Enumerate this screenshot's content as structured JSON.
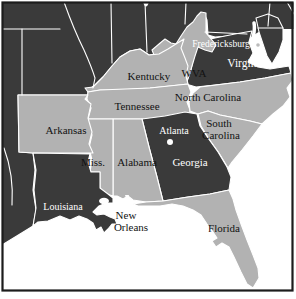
{
  "map": {
    "description_visible_text_only": true,
    "colors": {
      "dark_state": "#3a3a3a",
      "light_state": "#b2b2b2",
      "water": "#ffffff",
      "state_border": "#ffffff",
      "frame": "#1c1c1c",
      "label_dark_text": "#121212",
      "label_light_text": "#ffffff"
    },
    "labels": [
      {
        "id": "fredericksburg",
        "text": "Fredericksburg",
        "x": 221,
        "y": 47,
        "fill": "#ffffff",
        "size": 9.5
      },
      {
        "id": "wva",
        "text": "WVA",
        "x": 194,
        "y": 77,
        "fill": "#121212",
        "size": 11
      },
      {
        "id": "virginia",
        "text": "Virginia",
        "x": 246,
        "y": 67,
        "fill": "#ffffff",
        "size": 11.5
      },
      {
        "id": "kentucky",
        "text": "Kentucky",
        "x": 149,
        "y": 80,
        "fill": "#121212",
        "size": 11
      },
      {
        "id": "tennessee",
        "text": "Tennessee",
        "x": 137,
        "y": 110,
        "fill": "#121212",
        "size": 11
      },
      {
        "id": "north-carolina",
        "text": "North Carolina",
        "x": 208,
        "y": 101,
        "fill": "#121212",
        "size": 11
      },
      {
        "id": "arkansas",
        "text": "Arkansas",
        "x": 66,
        "y": 134,
        "fill": "#121212",
        "size": 11
      },
      {
        "id": "south",
        "text": "South",
        "x": 219,
        "y": 127,
        "fill": "#121212",
        "size": 11
      },
      {
        "id": "carolina",
        "text": "Carolina",
        "x": 221,
        "y": 139,
        "fill": "#121212",
        "size": 11
      },
      {
        "id": "atlanta",
        "text": "Atlanta",
        "x": 174,
        "y": 134,
        "fill": "#ffffff",
        "size": 10
      },
      {
        "id": "miss",
        "text": "Miss.",
        "x": 93,
        "y": 166,
        "fill": "#121212",
        "size": 11
      },
      {
        "id": "alabama",
        "text": "Alabama",
        "x": 137,
        "y": 166,
        "fill": "#121212",
        "size": 11
      },
      {
        "id": "georgia",
        "text": "Georgia",
        "x": 190,
        "y": 166,
        "fill": "#ffffff",
        "size": 11
      },
      {
        "id": "louisiana",
        "text": "Louisiana",
        "x": 63,
        "y": 210,
        "fill": "#ffffff",
        "size": 10
      },
      {
        "id": "new",
        "text": "New",
        "x": 126,
        "y": 219,
        "fill": "#121212",
        "size": 11
      },
      {
        "id": "orleans",
        "text": "Orleans",
        "x": 131,
        "y": 231,
        "fill": "#121212",
        "size": 11
      },
      {
        "id": "florida",
        "text": "Florida",
        "x": 224,
        "y": 232,
        "fill": "#121212",
        "size": 11
      }
    ],
    "cities": [
      {
        "id": "atlanta-dot",
        "x": 170,
        "y": 142,
        "r": 3,
        "fill": "#ffffff"
      },
      {
        "id": "fredericksburg-dot",
        "x": 258,
        "y": 45,
        "r": 1.8,
        "fill": "#bbbbbb"
      }
    ]
  }
}
